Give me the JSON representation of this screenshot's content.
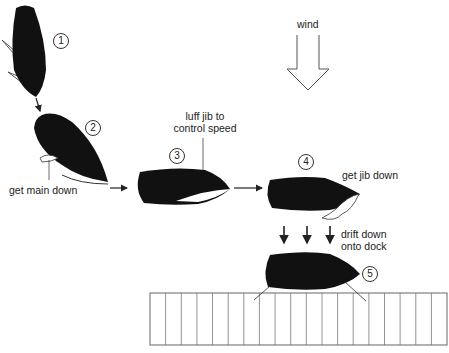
{
  "diagram": {
    "wind": {
      "label": "wind",
      "direction": "down"
    },
    "steps": [
      {
        "number": "1",
        "description": ""
      },
      {
        "number": "2",
        "description": "get main down"
      },
      {
        "number": "3",
        "description": "luff jib to control speed",
        "lines": [
          "luff jib to",
          "control speed"
        ]
      },
      {
        "number": "4",
        "description": "get jib down"
      },
      {
        "number": "5",
        "description": "drift down onto dock",
        "lines": [
          "drift down",
          "onto dock"
        ]
      }
    ],
    "dock": {
      "planks": 19
    },
    "colors": {
      "hull": "#111111",
      "outline": "#333333",
      "background": "#ffffff"
    }
  }
}
